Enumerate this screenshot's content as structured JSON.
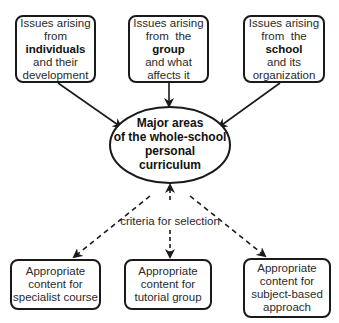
{
  "diagram": {
    "sources": [
      {
        "lines": [
          "Issues arising",
          "from",
          "individuals",
          "and their",
          "development"
        ],
        "bold_index": 2
      },
      {
        "lines": [
          "Issues arising",
          "from  the",
          "group",
          "and what",
          "affects it"
        ],
        "bold_index": 2
      },
      {
        "lines": [
          "Issues arising",
          "from  the",
          "school",
          "and its",
          "organization"
        ],
        "bold_index": 2
      }
    ],
    "center": {
      "lines": [
        "Major areas",
        "of the whole-school",
        "personal",
        "curriculum"
      ]
    },
    "connector_label": "criteria for selection",
    "outputs": [
      {
        "lines": [
          "Appropriate",
          "content for",
          "specialist course"
        ]
      },
      {
        "lines": [
          "Appropriate",
          "content for",
          "tutorial group"
        ]
      },
      {
        "lines": [
          "Appropriate",
          "content for",
          "subject-based",
          "approach"
        ]
      }
    ],
    "colors": {
      "stroke": "#1a1a1a",
      "text": "#2a2a2a",
      "background": "#ffffff"
    }
  }
}
